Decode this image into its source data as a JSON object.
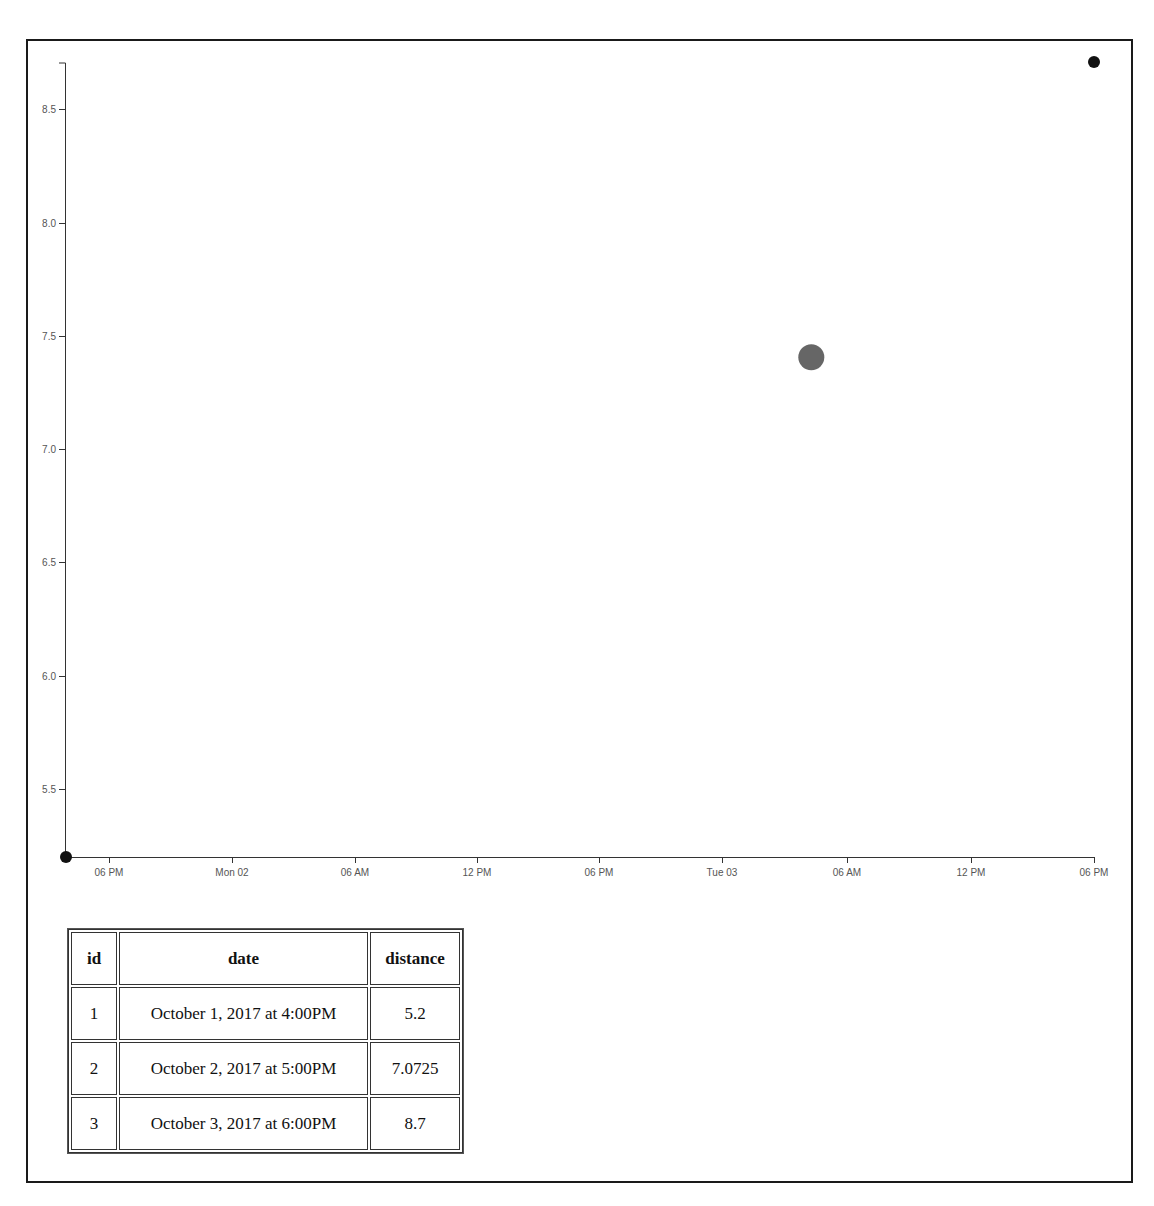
{
  "chart_data": {
    "type": "scatter",
    "title": "",
    "xlabel": "",
    "ylabel": "",
    "x_type": "time",
    "xlim": [
      "2017-10-01T16:00",
      "2017-10-03T18:00"
    ],
    "ylim": [
      5.2,
      8.7
    ],
    "grid": false,
    "legend": null,
    "x_ticks": [
      "06 PM",
      "Mon 02",
      "06 AM",
      "12 PM",
      "06 PM",
      "Tue 03",
      "06 AM",
      "12 PM",
      "06 PM"
    ],
    "y_ticks": [
      "5.5",
      "6.0",
      "6.5",
      "7.0",
      "7.5",
      "8.0",
      "8.5"
    ],
    "series": [
      {
        "name": "distance",
        "points": [
          {
            "x": "2017-10-01T16:00",
            "y": 5.2,
            "color": "#111111",
            "r": 6
          },
          {
            "x": "2017-10-03T04:15",
            "y": 7.4,
            "color": "#666666",
            "r": 13
          },
          {
            "x": "2017-10-03T18:00",
            "y": 8.7,
            "color": "#111111",
            "r": 6
          }
        ]
      }
    ]
  },
  "axes": {
    "x_ticks": [
      {
        "label": "06 PM",
        "px": 109
      },
      {
        "label": "Mon 02",
        "px": 232
      },
      {
        "label": "06 AM",
        "px": 355
      },
      {
        "label": "12 PM",
        "px": 477
      },
      {
        "label": "06 PM",
        "px": 599
      },
      {
        "label": "Tue 03",
        "px": 722
      },
      {
        "label": "06 AM",
        "px": 847
      },
      {
        "label": "12 PM",
        "px": 971
      },
      {
        "label": "06 PM",
        "px": 1094
      }
    ],
    "y_ticks": [
      {
        "label": "8.5",
        "py": 109
      },
      {
        "label": "8.0",
        "py": 223
      },
      {
        "label": "7.5",
        "py": 336
      },
      {
        "label": "7.0",
        "py": 449
      },
      {
        "label": "6.5",
        "py": 562
      },
      {
        "label": "6.0",
        "py": 676
      },
      {
        "label": "5.5",
        "py": 789
      }
    ]
  },
  "table": {
    "headers": [
      "id",
      "date",
      "distance"
    ],
    "rows": [
      [
        "1",
        "October 1, 2017 at 4:00PM",
        "5.2"
      ],
      [
        "2",
        "October 2, 2017 at 5:00PM",
        "7.0725"
      ],
      [
        "3",
        "October 3, 2017 at 6:00PM",
        "8.7"
      ]
    ]
  }
}
